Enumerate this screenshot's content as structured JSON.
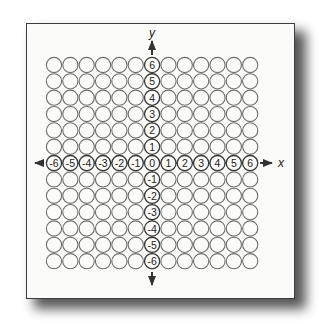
{
  "diagram": {
    "type": "coordinate-grid-of-circles",
    "x_axis": {
      "label": "x",
      "ticks": [
        "-6",
        "-5",
        "-4",
        "-3",
        "-2",
        "-1",
        "0",
        "1",
        "2",
        "3",
        "4",
        "5",
        "6"
      ]
    },
    "y_axis": {
      "label": "y",
      "ticks": [
        "6",
        "5",
        "4",
        "3",
        "2",
        "1",
        "0",
        "-1",
        "-2",
        "-3",
        "-4",
        "-5",
        "-6"
      ]
    },
    "grid": {
      "columns": 13,
      "rows": 13,
      "range_min": -6,
      "range_max": 6
    },
    "colors": {
      "circle_stroke": "#6e6e6e",
      "axis_stroke": "#333333",
      "label_text": "#222222",
      "paper": "#fbfbfa",
      "border": "#3c3c3c"
    }
  }
}
